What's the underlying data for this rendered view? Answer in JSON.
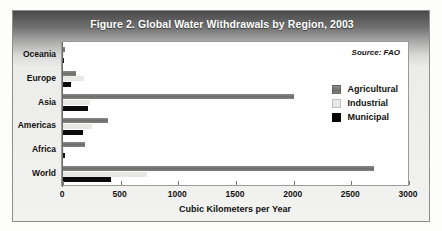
{
  "figure": {
    "title": "Figure 2. Global Water Withdrawals by Region, 2003",
    "source": "Source: FAO"
  },
  "legend": {
    "position": "top-right-inside",
    "items": [
      {
        "label": "Agricultural",
        "color": "#6e6e6c"
      },
      {
        "label": "Industrial",
        "color": "#e8e8e6"
      },
      {
        "label": "Municipal",
        "color": "#0b0b0b"
      }
    ]
  },
  "chart_data": {
    "type": "bar",
    "orientation": "horizontal",
    "title": "Figure 2. Global Water Withdrawals by Region, 2003",
    "xlabel": "Cubic Kilometers per Year",
    "ylabel": "",
    "xlim": [
      0,
      3000
    ],
    "xticks": [
      0,
      500,
      1000,
      1500,
      2000,
      2500,
      3000
    ],
    "xtick_labels": [
      "0",
      "500",
      "1000",
      "1500",
      "2000",
      "2500",
      "3000"
    ],
    "grid": false,
    "categories": [
      "Oceania",
      "Europe",
      "Asia",
      "Americas",
      "Africa",
      "World"
    ],
    "series": [
      {
        "name": "Agricultural",
        "color": "#6e6e6c",
        "values": [
          17,
          110,
          2000,
          390,
          190,
          2700
        ]
      },
      {
        "name": "Industrial",
        "color": "#e8e8e6",
        "values": [
          3,
          180,
          230,
          250,
          10,
          730
        ]
      },
      {
        "name": "Municipal",
        "color": "#0b0b0b",
        "values": [
          5,
          70,
          220,
          170,
          15,
          420
        ]
      }
    ],
    "annotations": [
      "Source: FAO"
    ]
  }
}
